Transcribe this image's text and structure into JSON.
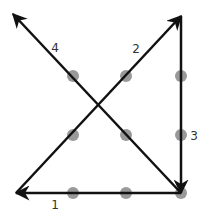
{
  "puzzle": {
    "name": "nine-dots",
    "dot_color": "#999999",
    "line_color": "#111111",
    "dots": [
      {
        "x": 73,
        "y": 76
      },
      {
        "x": 126,
        "y": 76
      },
      {
        "x": 181,
        "y": 76
      },
      {
        "x": 73,
        "y": 135
      },
      {
        "x": 126,
        "y": 135
      },
      {
        "x": 181,
        "y": 135
      },
      {
        "x": 73,
        "y": 193
      },
      {
        "x": 126,
        "y": 193
      },
      {
        "x": 181,
        "y": 193
      }
    ],
    "strokes": [
      {
        "order": "1",
        "from": {
          "x": 181,
          "y": 193
        },
        "to": {
          "x": 16,
          "y": 193
        },
        "label_pos": {
          "x": 55,
          "y": 209
        }
      },
      {
        "order": "2",
        "from": {
          "x": 16,
          "y": 193
        },
        "to": {
          "x": 181,
          "y": 16
        },
        "label_pos": {
          "x": 136,
          "y": 53
        }
      },
      {
        "order": "3",
        "from": {
          "x": 181,
          "y": 16
        },
        "to": {
          "x": 181,
          "y": 193
        },
        "label_pos": {
          "x": 194,
          "y": 140
        }
      },
      {
        "order": "4",
        "from": {
          "x": 181,
          "y": 193
        },
        "to": {
          "x": 13,
          "y": 14
        },
        "label_pos": {
          "x": 55,
          "y": 52
        }
      }
    ]
  }
}
